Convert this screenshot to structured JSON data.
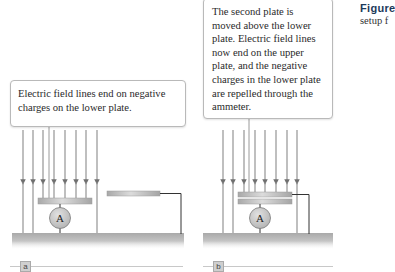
{
  "figure": {
    "label": "Figure",
    "caption_fragment": "setup f"
  },
  "panels": [
    {
      "id": "a",
      "tag": "a",
      "callout": "Electric field lines end on negative charges on the lower plate."
    },
    {
      "id": "b",
      "tag": "b",
      "callout": "The second plate is moved above the lower plate. Electric field lines now end on the upper plate, and the negative charges in the lower plate are repelled through the ammeter."
    }
  ],
  "ammeter_symbol": "A",
  "colors": {
    "field_line": "#8a8a8a",
    "plate": "#b5b5b5",
    "ground": "#bdbdbd",
    "ammeter_fill": "#c4c4c4",
    "wire": "#333333",
    "callout_border": "#b9b9b9"
  }
}
